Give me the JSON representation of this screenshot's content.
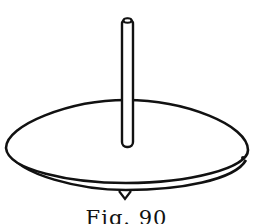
{
  "figure": {
    "caption": "Fig. 90",
    "colors": {
      "ink": "#111111",
      "paper": "#ffffff"
    }
  }
}
